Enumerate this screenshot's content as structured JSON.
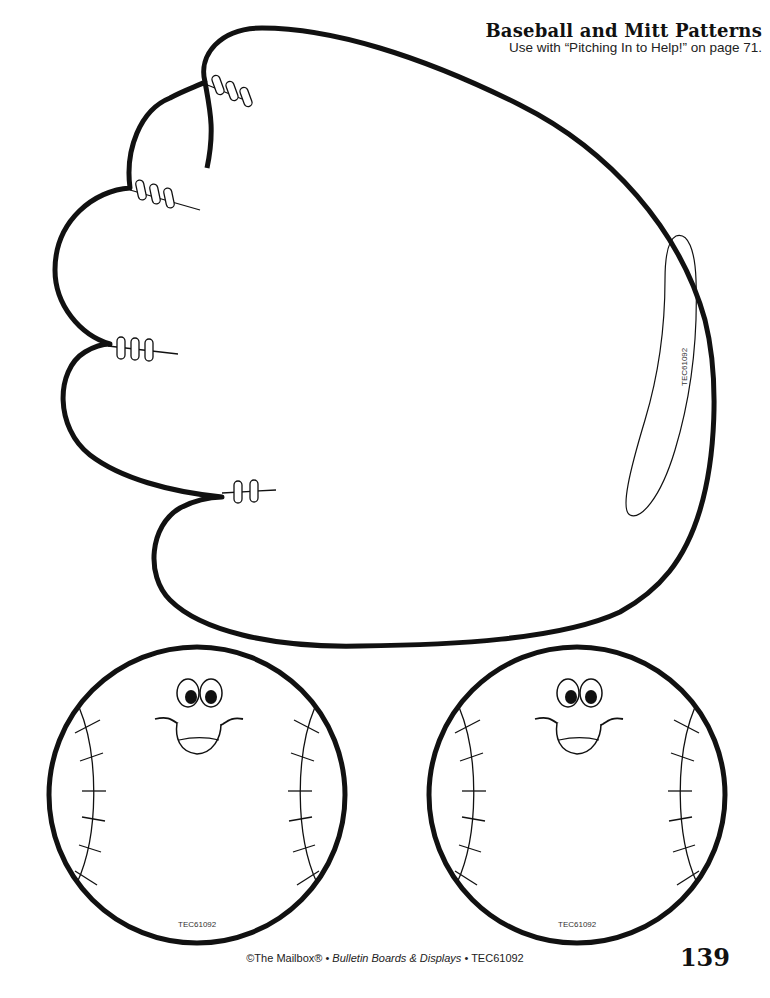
{
  "header": {
    "title": "Baseball and Mitt Patterns",
    "subtitle": "Use with “Pitching In to Help!” on page 71."
  },
  "patterns": {
    "mitt": {
      "label": "mitt-pattern",
      "code": "TEC61092"
    },
    "baseballs": [
      {
        "label": "baseball-pattern-1",
        "code": "TEC61092"
      },
      {
        "label": "baseball-pattern-2",
        "code": "TEC61092"
      }
    ]
  },
  "footer": {
    "copyright": "©The Mailbox® • ",
    "publication": "Bulletin Boards & Displays",
    "code": " • TEC61092",
    "page_number": "139"
  },
  "colors": {
    "ink": "#111111",
    "paper": "#ffffff"
  }
}
